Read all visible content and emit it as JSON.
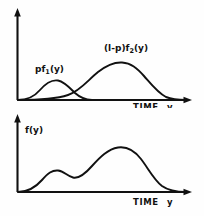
{
  "figure": {
    "background_color": "#fefefe",
    "ink_color": "#111111",
    "panels": [
      {
        "id": "components",
        "x_axis_label_main": "TIME",
        "x_axis_label_var": "y",
        "curve_labels": [
          {
            "prefix": "pf",
            "subscript": "1",
            "suffix": "(y)"
          },
          {
            "prefix": "(l-p)f",
            "subscript": "2",
            "suffix": "(y)"
          }
        ]
      },
      {
        "id": "mixture",
        "y_axis_label": "f(y)",
        "x_axis_label_main": "TIME",
        "x_axis_label_var": "y"
      }
    ]
  },
  "chart_data": {
    "type": "line",
    "title": "",
    "xlabel": "TIME y",
    "ylabel": "",
    "grid": false,
    "legend_position": "inline-annotations",
    "panels": [
      {
        "name": "components",
        "xlim": [
          0,
          100
        ],
        "ylim": [
          0,
          100
        ],
        "series": [
          {
            "name": "pf1(y)",
            "label": "pf₁(y)",
            "annotation_xy": [
              22,
              52
            ],
            "peak_x": 24,
            "peak_y": 27,
            "x": [
              0,
              4,
              9,
              14,
              18,
              22,
              24,
              27,
              31,
              36,
              41,
              46,
              52,
              58,
              64,
              70,
              78,
              88,
              100
            ],
            "y": [
              0,
              2,
              6,
              13,
              21,
              26,
              27,
              26,
              23,
              18,
              13,
              9,
              6,
              3,
              2,
              1,
              0,
              0,
              0
            ]
          },
          {
            "name": "(1-p)f2(y)",
            "label": "(l-p)f₂(y)",
            "annotation_xy": [
              55,
              76
            ],
            "peak_x": 60,
            "peak_y": 44,
            "x": [
              0,
              18,
              24,
              30,
              36,
              42,
              48,
              54,
              58,
              62,
              66,
              72,
              78,
              84,
              90,
              95,
              100
            ],
            "y": [
              0,
              0,
              1,
              4,
              10,
              19,
              30,
              40,
              43,
              44,
              42,
              34,
              23,
              13,
              6,
              2,
              1
            ]
          }
        ]
      },
      {
        "name": "mixture",
        "xlim": [
          0,
          100
        ],
        "ylim": [
          0,
          100
        ],
        "series": [
          {
            "name": "f(y)",
            "label": "f(y)",
            "annotation_xy": [
              8,
              80
            ],
            "modes": [
              {
                "x": 23,
                "y": 24
              },
              {
                "x": 62,
                "y": 50
              }
            ],
            "antimode": {
              "x": 37,
              "y": 19
            },
            "x": [
              0,
              6,
              12,
              18,
              22,
              26,
              31,
              36,
              40,
              45,
              50,
              56,
              61,
              65,
              70,
              75,
              80,
              86,
              92,
              97,
              100
            ],
            "y": [
              0,
              4,
              12,
              21,
              24,
              23,
              20,
              19,
              20,
              27,
              37,
              46,
              50,
              49,
              44,
              35,
              23,
              12,
              4,
              1,
              1
            ]
          }
        ]
      }
    ]
  }
}
